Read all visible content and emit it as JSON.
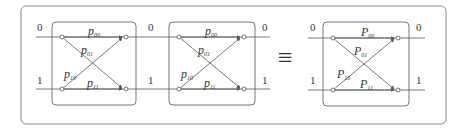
{
  "diagram": {
    "equivalence_symbol": "≡",
    "colors": {
      "stroke": "#555555",
      "box": "#777777",
      "text": "#333333"
    },
    "channels": [
      {
        "id": "channel-1",
        "input_labels": [
          "0",
          "1"
        ],
        "output_labels": [
          "0",
          "1"
        ],
        "letter": "p",
        "edges": [
          {
            "sub": "00",
            "from": "0",
            "to": "0"
          },
          {
            "sub": "01",
            "from": "0",
            "to": "1"
          },
          {
            "sub": "10",
            "from": "1",
            "to": "0"
          },
          {
            "sub": "11",
            "from": "1",
            "to": "1"
          }
        ]
      },
      {
        "id": "channel-2",
        "input_labels": [
          "0",
          "1"
        ],
        "output_labels": [
          "0",
          "1"
        ],
        "letter": "p",
        "edges": [
          {
            "sub": "00",
            "from": "0",
            "to": "0"
          },
          {
            "sub": "01",
            "from": "0",
            "to": "1"
          },
          {
            "sub": "10",
            "from": "1",
            "to": "0"
          },
          {
            "sub": "11",
            "from": "1",
            "to": "1"
          }
        ]
      },
      {
        "id": "channel-equivalent",
        "input_labels": [
          "0",
          "1"
        ],
        "output_labels": [
          "0",
          "1"
        ],
        "letter": "P",
        "edges": [
          {
            "sub": "00",
            "from": "0",
            "to": "0"
          },
          {
            "sub": "01",
            "from": "0",
            "to": "1"
          },
          {
            "sub": "10",
            "from": "1",
            "to": "0"
          },
          {
            "sub": "11",
            "from": "1",
            "to": "1"
          }
        ]
      }
    ]
  }
}
